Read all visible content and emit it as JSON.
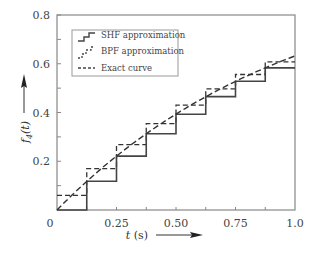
{
  "chart_data": {
    "type": "line",
    "title": "",
    "xlabel": "t (s)",
    "ylabel": "f4(t)",
    "xlim": [
      0,
      1.0
    ],
    "ylim": [
      0,
      0.8
    ],
    "x_ticks": [
      0,
      0.25,
      0.5,
      0.75,
      1.0
    ],
    "x_tick_labels": [
      "0",
      "0.25",
      "0.50",
      "0.75",
      "1.0"
    ],
    "y_ticks": [
      0.2,
      0.4,
      0.6,
      0.8
    ],
    "y_tick_labels": [
      "0.2",
      "0.4",
      "0.6",
      "0.8"
    ],
    "y_minor_ticks": [
      0.1,
      0.3,
      0.5,
      0.7
    ],
    "x_minor_ticks": [
      0.125,
      0.375,
      0.625,
      0.875
    ],
    "grid": false,
    "legend_position": "upper left",
    "series": [
      {
        "name": "SHF approximation",
        "style": "solid-step",
        "interval_edges": [
          0,
          0.125,
          0.25,
          0.375,
          0.5,
          0.625,
          0.75,
          0.875,
          1.0
        ],
        "values": [
          0.0,
          0.118,
          0.221,
          0.313,
          0.393,
          0.465,
          0.528,
          0.583
        ]
      },
      {
        "name": "BPF approximation",
        "style": "dashed-step",
        "interval_edges": [
          0,
          0.125,
          0.25,
          0.375,
          0.5,
          0.625,
          0.75,
          0.875,
          1.0
        ],
        "values": [
          0.06,
          0.17,
          0.268,
          0.354,
          0.43,
          0.497,
          0.556,
          0.608
        ]
      },
      {
        "name": "Exact curve",
        "style": "dashed",
        "x": [
          0,
          0.125,
          0.25,
          0.375,
          0.5,
          0.625,
          0.75,
          0.875,
          1.0
        ],
        "values": [
          0.0,
          0.118,
          0.221,
          0.313,
          0.393,
          0.465,
          0.528,
          0.583,
          0.632
        ]
      }
    ]
  },
  "legend": {
    "items": [
      {
        "label": "SHF approximation"
      },
      {
        "label": "BPF approximation"
      },
      {
        "label": "Exact curve"
      }
    ]
  },
  "axes": {
    "x_title": "t (s)",
    "y_title_main": "f",
    "y_title_sub": "4",
    "y_title_arg": "(t)",
    "origin_label": "0"
  }
}
